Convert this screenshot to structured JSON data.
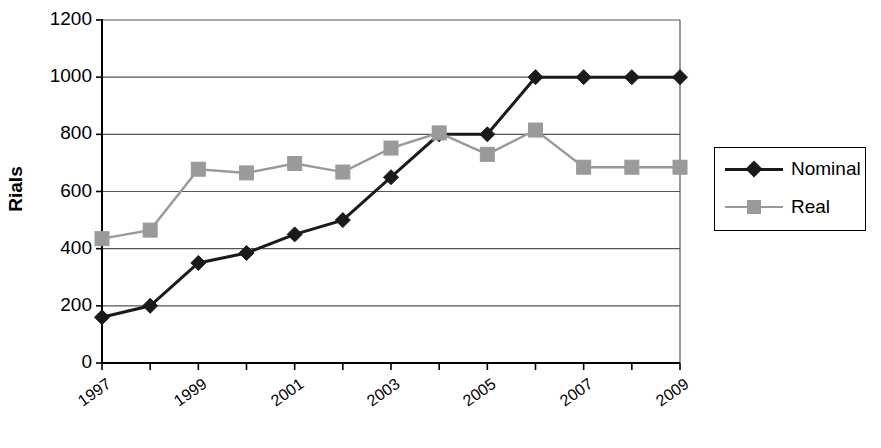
{
  "chart_data": {
    "type": "line",
    "title": "",
    "subtitle": "",
    "xlabel": "",
    "ylabel": "Rials",
    "x": [
      1997,
      1998,
      1999,
      2000,
      2001,
      2002,
      2003,
      2004,
      2005,
      2006,
      2007,
      2008,
      2009
    ],
    "categories": [
      "1997",
      "1998",
      "1999",
      "2000",
      "2001",
      "2002",
      "2003",
      "2004",
      "2005",
      "2006",
      "2007",
      "2008",
      "2009"
    ],
    "xtick_labels": [
      "1997",
      "1999",
      "2001",
      "2003",
      "2005",
      "2007",
      "2009"
    ],
    "xtick_values": [
      1997,
      1999,
      2001,
      2003,
      2005,
      2007,
      2009
    ],
    "ytick_labels": [
      "0",
      "200",
      "400",
      "600",
      "800",
      "1000",
      "1200"
    ],
    "ytick_values": [
      0,
      200,
      400,
      600,
      800,
      1000,
      1200
    ],
    "ylim": [
      0,
      1200
    ],
    "xlim": [
      1997,
      2009
    ],
    "grid": "horizontal",
    "legend_position": "right",
    "series": [
      {
        "name": "Nominal",
        "color": "#1a1a1a",
        "marker": "diamond",
        "values": [
          160,
          200,
          350,
          385,
          450,
          500,
          650,
          800,
          800,
          1000,
          1000,
          1000,
          1000
        ]
      },
      {
        "name": "Real",
        "color": "#9a9a9a",
        "marker": "square",
        "values": [
          435,
          465,
          678,
          665,
          698,
          668,
          752,
          805,
          730,
          815,
          685,
          685,
          685
        ]
      }
    ]
  },
  "legend": {
    "items": [
      {
        "label": "Nominal"
      },
      {
        "label": "Real"
      }
    ]
  },
  "axes": {
    "y_title": "Rials"
  },
  "colors": {
    "nominal": "#1a1a1a",
    "real": "#9a9a9a",
    "axis": "#000000",
    "grid": "#555555",
    "background": "#ffffff"
  }
}
